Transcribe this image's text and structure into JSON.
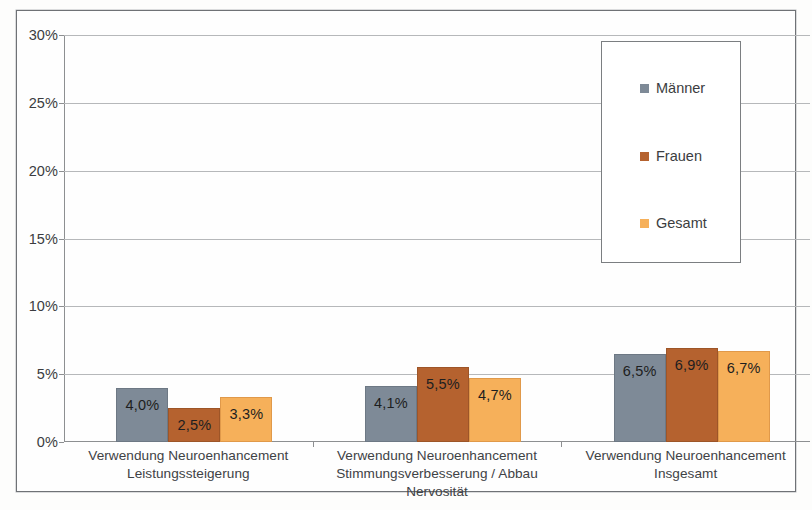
{
  "chart_data": {
    "type": "bar",
    "title": "",
    "subtitle": "",
    "xlabel": "",
    "ylabel": "",
    "ylim": [
      0,
      30
    ],
    "ytick_labels": [
      "0%",
      "5%",
      "10%",
      "15%",
      "20%",
      "25%",
      "30%"
    ],
    "ytick_values": [
      0,
      5,
      10,
      15,
      20,
      25,
      30
    ],
    "grid": true,
    "legend_position": "upper-right-inside",
    "value_suffix": "%",
    "decimal_separator": ",",
    "categories": [
      "Verwendung Neuroenhancement Leistungssteigerung",
      "Verwendung Neuroenhancement Stimmungsverbesserung / Abbau Nervosität",
      "Verwendung Neuroenhancement Insgesamt"
    ],
    "category_lines": [
      [
        "Verwendung Neuroenhancement",
        "Leistungssteigerung"
      ],
      [
        "Verwendung Neuroenhancement",
        "Stimmungsverbesserung / Abbau",
        "Nervosität"
      ],
      [
        "Verwendung Neuroenhancement",
        "Insgesamt"
      ]
    ],
    "series": [
      {
        "name": "Männer",
        "color": "#7e8a97",
        "values": [
          4.0,
          4.1,
          6.5
        ],
        "labels": [
          "4,0%",
          "4,1%",
          "6,5%"
        ]
      },
      {
        "name": "Frauen",
        "color": "#b5622f",
        "values": [
          2.5,
          5.5,
          6.9
        ],
        "labels": [
          "2,5%",
          "5,5%",
          "6,9%"
        ]
      },
      {
        "name": "Gesamt",
        "color": "#f6b05a",
        "values": [
          3.3,
          4.7,
          6.7
        ],
        "labels": [
          "3,3%",
          "4,7%",
          "6,7%"
        ]
      }
    ]
  },
  "legend": {
    "items": [
      {
        "label": "Männer",
        "color": "#7e8a97"
      },
      {
        "label": "Frauen",
        "color": "#b5622f"
      },
      {
        "label": "Gesamt",
        "color": "#f6b05a"
      }
    ]
  },
  "axis": {
    "y_labels": [
      "30%",
      "25%",
      "20%",
      "15%",
      "10%",
      "5%",
      "0%"
    ]
  }
}
